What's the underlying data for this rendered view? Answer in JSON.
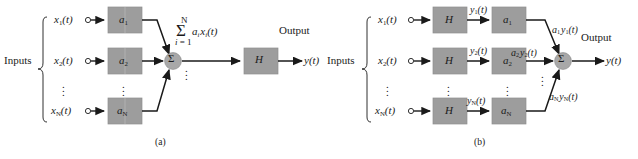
{
  "figure": {
    "background": "#ffffff",
    "block_fill": "#9d9d9d",
    "block_stroke": "#8a8a8a",
    "node_fill": "#a8a8a8",
    "line_color": "#1a1a1a",
    "panels": [
      {
        "id": "a",
        "caption": "(a)",
        "inputs_label": "Inputs",
        "output_label": "Output",
        "input_signals": [
          {
            "base": "x",
            "sub": "1",
            "arg": "(t)",
            "text": "x1(t)"
          },
          {
            "base": "x",
            "sub": "2",
            "arg": "(t)",
            "text": "x2(t)"
          },
          {
            "base": "x",
            "sub": "N",
            "arg": "(t)",
            "text": "xN(t)"
          }
        ],
        "gain_blocks": [
          {
            "base": "a",
            "sub": "1",
            "text": "a1"
          },
          {
            "base": "a",
            "sub": "2",
            "text": "a2"
          },
          {
            "base": "a",
            "sub": "N",
            "text": "aN"
          }
        ],
        "summation_node": "Σ",
        "sum_expression": {
          "upper_limit": "N",
          "sigma": "Σ",
          "lower_limit": "i = 1",
          "body_base": "a",
          "body_sub1": "i",
          "body_base2": "x",
          "body_sub2": "i",
          "body_arg": "(t)",
          "text": "sum i=1 to N of a_i x_i(t)"
        },
        "filter_block": "H",
        "output_signal": {
          "base": "y",
          "arg": "(t)",
          "text": "y(t)"
        },
        "ellipsis": "⋮"
      },
      {
        "id": "b",
        "caption": "(b)",
        "inputs_label": "Inputs",
        "output_label": "Output",
        "input_signals": [
          {
            "base": "x",
            "sub": "1",
            "arg": "(t)",
            "text": "x1(t)"
          },
          {
            "base": "x",
            "sub": "2",
            "arg": "(t)",
            "text": "x2(t)"
          },
          {
            "base": "x",
            "sub": "N",
            "arg": "(t)",
            "text": "xN(t)"
          }
        ],
        "filter_blocks": [
          "H",
          "H",
          "H"
        ],
        "intermediate_signals": [
          {
            "base": "y",
            "sub": "1",
            "arg": "(t)",
            "text": "y1(t)"
          },
          {
            "base": "y",
            "sub": "2",
            "arg": "(t)",
            "text": "y2(t)"
          },
          {
            "base": "y",
            "sub": "N",
            "arg": "(t)",
            "text": "yN(t)"
          }
        ],
        "gain_blocks": [
          {
            "base": "a",
            "sub": "1",
            "text": "a1"
          },
          {
            "base": "a",
            "sub": "2",
            "text": "a2"
          },
          {
            "base": "a",
            "sub": "N",
            "text": "aN"
          }
        ],
        "weighted_signals": [
          {
            "g": "a",
            "gsub": "1",
            "s": "y",
            "ssub": "1",
            "arg": "(t)",
            "text": "a1 y1(t)"
          },
          {
            "g": "a",
            "gsub": "2",
            "s": "y",
            "ssub": "2",
            "arg": "(t)",
            "text": "a2 y2(t)"
          },
          {
            "g": "a",
            "gsub": "N",
            "s": "y",
            "ssub": "N",
            "arg": "(t)",
            "text": "aN yN(t)"
          }
        ],
        "summation_node": "Σ",
        "output_signal": {
          "base": "y",
          "arg": "(t)",
          "text": "y(t)"
        },
        "ellipsis": "⋮"
      }
    ]
  }
}
